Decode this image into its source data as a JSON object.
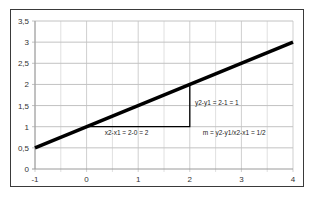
{
  "chart_data": {
    "type": "line",
    "title": "",
    "xlabel": "",
    "ylabel": "",
    "xlim": [
      -1,
      4
    ],
    "ylim": [
      0,
      3.5
    ],
    "grid": true,
    "legend": "none",
    "x_ticks": [
      "-1",
      "0",
      "1",
      "2",
      "3",
      "4"
    ],
    "y_ticks": [
      "0",
      "0,5",
      "1",
      "1,5",
      "2",
      "2,5",
      "3",
      "3,5"
    ],
    "series": [
      {
        "name": "line",
        "x": [
          -1,
          4
        ],
        "y": [
          0.5,
          3
        ],
        "color": "#000000"
      }
    ],
    "slope_triangle": {
      "points": [
        [
          0,
          1
        ],
        [
          2,
          1
        ],
        [
          2,
          2
        ]
      ],
      "color": "#000000"
    },
    "annotations": [
      {
        "text": "x2-x1 = 2-0 = 2",
        "x": 0.35,
        "y": 0.85
      },
      {
        "text": "y2-y1 = 2-1 = 1",
        "x": 2.1,
        "y": 1.55
      },
      {
        "text": "m = y2-y1/x2-x1 = 1/2",
        "x": 2.25,
        "y": 0.85
      }
    ]
  }
}
